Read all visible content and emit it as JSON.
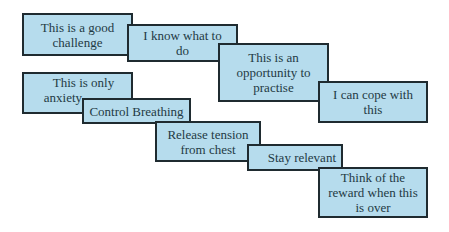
{
  "diagram": {
    "type": "staircase-cards",
    "colors": {
      "card_fill": "#b6dced",
      "card_border": "#1f2b30",
      "text": "#1f3a44"
    },
    "groups": [
      {
        "name": "first-sequence",
        "cards": [
          {
            "text": "This is a good challenge",
            "lines": [
              "This is a good",
              "challenge"
            ]
          },
          {
            "text": "I know what to do",
            "lines": [
              "I know what to",
              "do"
            ]
          },
          {
            "text": "This is an opportunity to practise",
            "lines": [
              "This is an",
              "opportunity to",
              "practise"
            ]
          },
          {
            "text": "I can cope with this",
            "lines": [
              "I can cope with",
              "this"
            ]
          }
        ]
      },
      {
        "name": "second-sequence",
        "cards": [
          {
            "text": "This is only anxiety",
            "lines": [
              "This is only",
              "anxiety"
            ]
          },
          {
            "text": "Control Breathing",
            "lines": [
              "Control Breathing"
            ]
          },
          {
            "text": "Release tension from chest",
            "lines": [
              "Release tension",
              "from chest"
            ]
          },
          {
            "text": "Stay relevant",
            "lines": [
              "Stay relevant"
            ]
          },
          {
            "text": "Think of the reward when this is over",
            "lines": [
              "Think of the",
              "reward when this",
              "is over"
            ]
          }
        ]
      }
    ]
  }
}
